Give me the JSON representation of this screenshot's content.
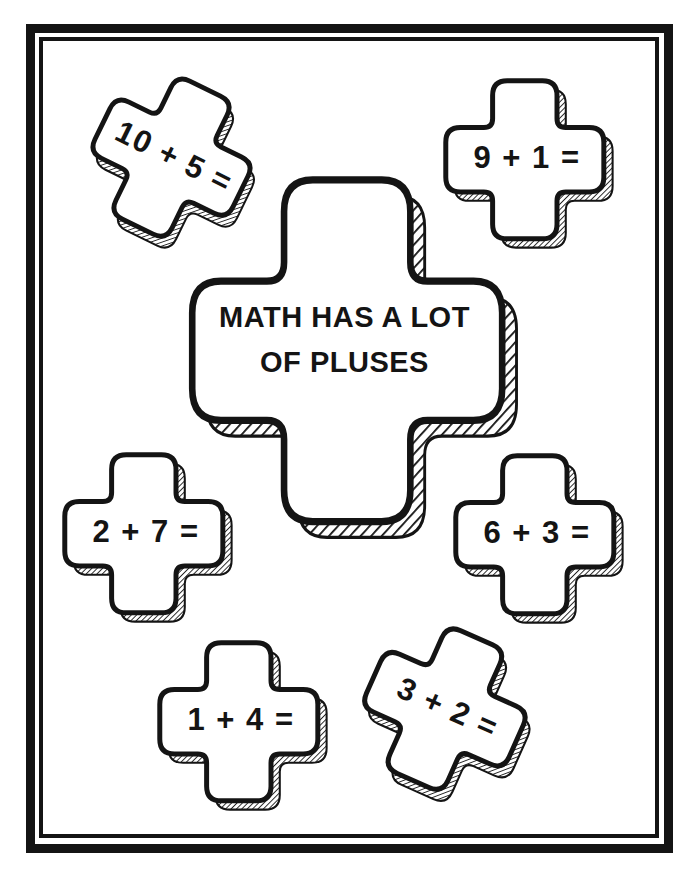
{
  "page": {
    "ink_color": "#141414",
    "paper_color": "#ffffff"
  },
  "title_cross": {
    "line1": "MATH HAS A LOT",
    "line2": "OF PLUSES"
  },
  "problems": [
    {
      "label": "10 + 5 ="
    },
    {
      "label": "9 + 1 ="
    },
    {
      "label": "2 + 7 ="
    },
    {
      "label": "6 + 3 ="
    },
    {
      "label": "1 + 4 ="
    },
    {
      "label": "3 + 2 ="
    }
  ]
}
